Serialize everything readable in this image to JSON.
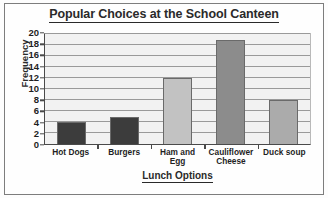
{
  "chart_data": {
    "type": "bar",
    "title": "Popular Choices at the School Canteen",
    "xlabel": "Lunch Options",
    "ylabel": "Frequency",
    "categories": [
      "Hot Dogs",
      "Burgers",
      "Ham and Egg",
      "Cauliflower Cheese",
      "Duck soup"
    ],
    "values": [
      4,
      5,
      12,
      19,
      8
    ],
    "bar_colors": [
      "#3c3c3c",
      "#3c3c3c",
      "#c2c2c2",
      "#8c8c8c",
      "#ababab"
    ],
    "ylim": [
      0,
      20
    ],
    "ytick_step": 2,
    "yticks": [
      0,
      2,
      4,
      6,
      8,
      10,
      12,
      14,
      16,
      18,
      20
    ],
    "ytick_labels": [
      "0",
      "2",
      "4",
      "6",
      "8",
      "10",
      "12",
      "14",
      "16",
      "18",
      "20"
    ],
    "grid": true,
    "grid_orientation": "horizontal",
    "legend": false,
    "plot_background": "#f2f2f2",
    "axis_color": "#4a4a4a",
    "gridline_color": "#9a9a9a",
    "text_color": "#1f1f1f"
  }
}
